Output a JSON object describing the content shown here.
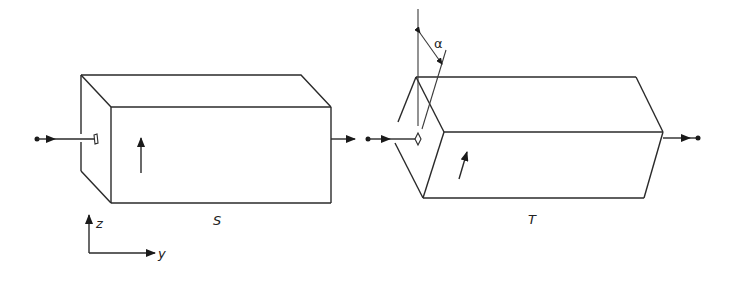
{
  "diagram": {
    "type": "optical-polarizer-setup",
    "elements": {
      "box_s": {
        "label": "S",
        "orientation": "aligned",
        "polarization_arrow": "vertical"
      },
      "box_t": {
        "label": "T",
        "orientation": "rotated",
        "polarization_arrow": "tilted"
      },
      "angle": {
        "symbol": "α"
      },
      "axes": {
        "z_label": "z",
        "y_label": "y"
      }
    },
    "colors": {
      "line": "#2a2a2a",
      "background": "#ffffff"
    }
  }
}
